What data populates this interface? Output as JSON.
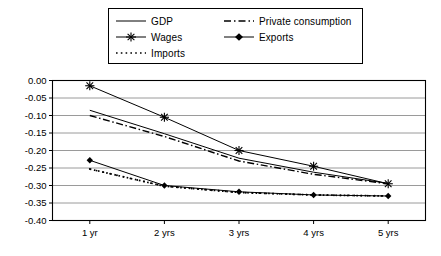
{
  "chart_data": {
    "type": "line",
    "title": "",
    "subtitle": "",
    "xlabel": "",
    "ylabel": "",
    "categories": [
      "1 yr",
      "2 yrs",
      "3 yrs",
      "4 yrs",
      "5 yrs"
    ],
    "ylim": [
      -0.4,
      0.0
    ],
    "ytick_labels": [
      "0.00",
      "-0.05",
      "-0.10",
      "-0.15",
      "-0.20",
      "-0.25",
      "-0.30",
      "-0.35",
      "-0.40"
    ],
    "ytick_values": [
      0.0,
      -0.05,
      -0.1,
      -0.15,
      -0.2,
      -0.25,
      -0.3,
      -0.35,
      -0.4
    ],
    "grid": true,
    "grid_axis": "y",
    "legend_position": "top",
    "series": [
      {
        "name": "GDP",
        "style": "solid",
        "marker": "none",
        "values": [
          -0.085,
          -0.152,
          -0.222,
          -0.262,
          -0.294
        ]
      },
      {
        "name": "Private consumption",
        "style": "dash-dot",
        "marker": "none",
        "values": [
          -0.1,
          -0.16,
          -0.23,
          -0.268,
          -0.295
        ]
      },
      {
        "name": "Wages",
        "style": "solid",
        "marker": "star",
        "values": [
          -0.015,
          -0.105,
          -0.2,
          -0.245,
          -0.295
        ]
      },
      {
        "name": "Exports",
        "style": "solid",
        "marker": "diamond",
        "values": [
          -0.228,
          -0.3,
          -0.318,
          -0.327,
          -0.33
        ]
      },
      {
        "name": "Imports",
        "style": "dotted",
        "marker": "none",
        "values": [
          -0.253,
          -0.302,
          -0.32,
          -0.327,
          -0.33
        ]
      }
    ]
  },
  "legend": {
    "entries": [
      {
        "label": "GDP",
        "marker": "line-solid"
      },
      {
        "label": "Private consumption",
        "marker": "line-dash-dot"
      },
      {
        "label": "Wages",
        "marker": "line-solid-star"
      },
      {
        "label": "Exports",
        "marker": "line-solid-diamond"
      },
      {
        "label": "Imports",
        "marker": "line-dotted"
      }
    ]
  },
  "colors": {
    "line": "#000000",
    "grid": "#808080",
    "frame": "#000000",
    "background": "#ffffff"
  }
}
